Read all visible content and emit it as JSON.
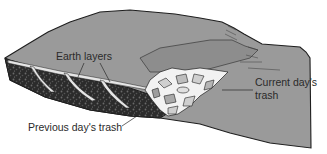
{
  "figure": {
    "labels": {
      "earth_layers": "Earth layers",
      "current_trash_line1": "Current day's",
      "current_trash_line2": "trash",
      "previous_trash": "Previous day's trash"
    },
    "colors": {
      "surface": "#9a9a9a",
      "surface_dark": "#8a8a8a",
      "outline": "#1e1e1e",
      "trash_layer": "#2b2b2b",
      "earth_band": "#e6e6e6",
      "fresh_trash": "#f2f2f2",
      "text": "#2a2a2a",
      "background": "#ffffff"
    }
  }
}
